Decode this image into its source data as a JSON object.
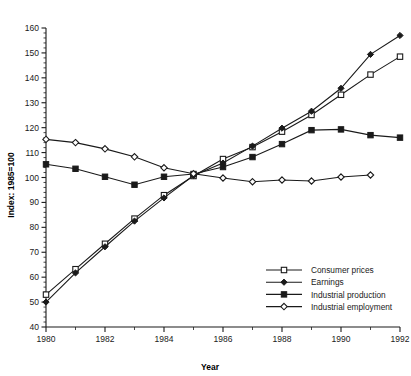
{
  "chart_data": {
    "type": "line",
    "title": "",
    "xlabel": "Year",
    "ylabel": "Index: 1985=100",
    "xlim": [
      1980,
      1992
    ],
    "ylim": [
      40,
      160
    ],
    "ytick_step": 10,
    "ytick_minor_step": 2,
    "xtick_step": 2,
    "xtick_minor_step": 1,
    "grid": false,
    "legend_position": "lower-right",
    "yticks": [
      40,
      50,
      60,
      70,
      80,
      90,
      100,
      110,
      120,
      130,
      140,
      150,
      160
    ],
    "xticks": [
      1980,
      1982,
      1984,
      1986,
      1988,
      1990,
      1992
    ],
    "x": [
      1980,
      1981,
      1982,
      1983,
      1984,
      1985,
      1986,
      1987,
      1988,
      1989,
      1990,
      1991,
      1992
    ],
    "series": [
      {
        "name": "Consumer prices",
        "marker": "open-square",
        "values": [
          53.0,
          63.2,
          73.4,
          83.5,
          92.9,
          100.6,
          107.4,
          112.2,
          118.4,
          125.1,
          133.2,
          141.3,
          148.5
        ]
      },
      {
        "name": "Earnings",
        "marker": "filled-diamond",
        "values": [
          50.0,
          61.7,
          72.2,
          82.5,
          91.8,
          100.8,
          105.8,
          112.6,
          119.8,
          126.6,
          135.8,
          149.4,
          157.0
        ]
      },
      {
        "name": "Industrial production",
        "marker": "filled-square",
        "values": [
          105.3,
          103.5,
          100.3,
          97.1,
          100.3,
          101.4,
          104.2,
          108.2,
          113.4,
          119.0,
          119.3,
          117.0,
          116.0
        ]
      },
      {
        "name": "Industrial employment",
        "marker": "open-diamond",
        "values": [
          115.3,
          114.0,
          111.5,
          108.3,
          103.9,
          101.5,
          99.8,
          98.3,
          99.0,
          98.6,
          100.2,
          101.0,
          null
        ]
      }
    ]
  },
  "legend": {
    "items": [
      {
        "label": "Consumer prices"
      },
      {
        "label": "Earnings"
      },
      {
        "label": "Industrial production"
      },
      {
        "label": "Industrial employment"
      }
    ]
  },
  "colors": {
    "ink": "#1a1a1a",
    "background": "#ffffff",
    "marker_fill": "#ffffff"
  }
}
